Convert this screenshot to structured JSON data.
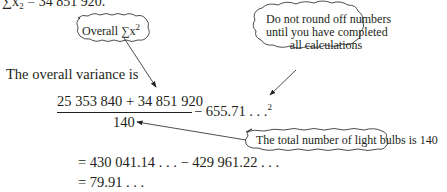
{
  "lines": {
    "sum_x2": "∑x₂ = 34 851 920.",
    "intro": "The overall variance is",
    "numerator": "25 353 840 + 34 851 920",
    "denominator": "140",
    "minus_mean_sq": "− 655.71 . . .",
    "exp": "2",
    "step1": "= 430 041.14 . . .  −  429 961.22 . . .",
    "step2": "= 79.91 . . ."
  },
  "callouts": {
    "overall_sum": "Overall ∑x",
    "overall_sum_exp": "2",
    "rounding_note": [
      "Do not round off numbers",
      "until you have completed",
      "all calculations"
    ],
    "total_bulbs": "The total number of light bulbs is 140"
  },
  "colors": {
    "text": "#231f20",
    "cloud_stroke": "#231f20",
    "background": "#ffffff"
  }
}
